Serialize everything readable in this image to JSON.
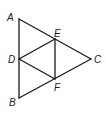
{
  "diagram": {
    "type": "geometry-figure",
    "line_color": "#1a1a1a",
    "points": {
      "A": {
        "label": "A",
        "x": 19,
        "y": 19,
        "lx": 7,
        "ly": 21
      },
      "B": {
        "label": "B",
        "x": 19,
        "y": 98,
        "lx": 9,
        "ly": 106
      },
      "C": {
        "label": "C",
        "x": 91,
        "y": 59,
        "lx": 94,
        "ly": 63
      },
      "D": {
        "label": "D",
        "x": 19,
        "y": 59,
        "lx": 8,
        "ly": 63
      },
      "E": {
        "label": "E",
        "x": 55,
        "y": 39,
        "lx": 54,
        "ly": 37
      },
      "F": {
        "label": "F",
        "x": 55,
        "y": 79,
        "lx": 54,
        "ly": 91
      }
    },
    "segments": [
      [
        "A",
        "B"
      ],
      [
        "A",
        "C"
      ],
      [
        "B",
        "C"
      ],
      [
        "D",
        "E"
      ],
      [
        "E",
        "F"
      ],
      [
        "D",
        "F"
      ]
    ]
  }
}
